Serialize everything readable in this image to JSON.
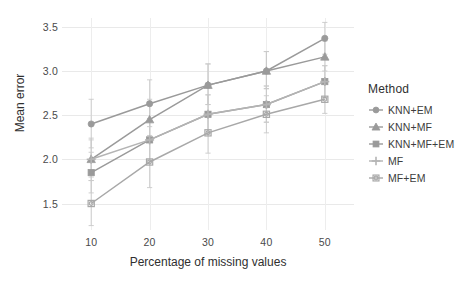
{
  "chart_data": {
    "type": "line",
    "title": "",
    "xlabel": "Percentage of missing values",
    "ylabel": "Mean error",
    "categories": [
      10,
      20,
      30,
      40,
      50
    ],
    "x": [
      10,
      20,
      30,
      40,
      50
    ],
    "xlim": [
      5,
      55
    ],
    "ylim": [
      1.2,
      3.6
    ],
    "xticks": [
      "10",
      "20",
      "30",
      "40",
      "50"
    ],
    "yticks": [
      "1.5",
      "2.0",
      "2.5",
      "3.0",
      "3.5"
    ],
    "ytick_values": [
      1.5,
      2.0,
      2.5,
      3.0,
      3.5
    ],
    "grid": true,
    "legend_position": "right",
    "errorbars": true,
    "series": [
      {
        "name": "KNN+EM",
        "marker": "circle",
        "color": "#9a9a9a",
        "values": [
          2.4,
          2.63,
          2.84,
          3.0,
          3.37
        ],
        "err_low": [
          2.13,
          2.37,
          2.62,
          2.8,
          3.19
        ],
        "err_high": [
          2.68,
          2.9,
          3.08,
          3.22,
          3.55
        ]
      },
      {
        "name": "KNN+MF",
        "marker": "triangle",
        "color": "#9a9a9a",
        "values": [
          2.0,
          2.45,
          2.84,
          3.0,
          3.16
        ],
        "err_low": [
          1.8,
          2.24,
          2.62,
          2.8,
          3.0
        ],
        "err_high": [
          2.22,
          2.68,
          3.08,
          3.22,
          3.34
        ]
      },
      {
        "name": "KNN+MF+EM",
        "marker": "square",
        "color": "#9a9a9a",
        "values": [
          1.85,
          2.22,
          2.51,
          2.62,
          2.88
        ],
        "err_low": [
          1.62,
          1.99,
          2.29,
          2.42,
          2.7
        ],
        "err_high": [
          2.08,
          2.46,
          2.73,
          2.83,
          3.06
        ]
      },
      {
        "name": "MF",
        "marker": "plus",
        "color": "#b4b4b4",
        "values": [
          2.0,
          2.22,
          2.51,
          2.62,
          2.88
        ],
        "err_low": [
          1.76,
          1.99,
          2.29,
          2.42,
          2.7
        ],
        "err_high": [
          2.24,
          2.46,
          2.73,
          2.83,
          3.06
        ]
      },
      {
        "name": "MF+EM",
        "marker": "square-circle",
        "color": "#a8a8a8",
        "values": [
          1.5,
          1.97,
          2.3,
          2.51,
          2.68
        ],
        "err_low": [
          1.25,
          1.68,
          2.07,
          2.3,
          2.52
        ],
        "err_high": [
          1.76,
          2.27,
          2.54,
          2.72,
          2.86
        ]
      }
    ]
  },
  "legend": {
    "title": "Method",
    "items": [
      {
        "label": "KNN+EM"
      },
      {
        "label": "KNN+MF"
      },
      {
        "label": "KNN+MF+EM"
      },
      {
        "label": "MF"
      },
      {
        "label": "MF+EM"
      }
    ]
  },
  "axes": {
    "x_title": "Percentage of missing values",
    "y_title": "Mean error"
  }
}
